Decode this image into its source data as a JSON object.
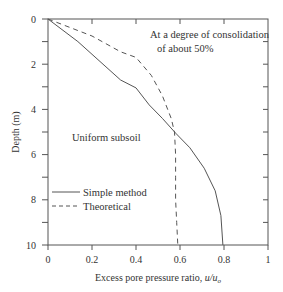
{
  "chart_data": {
    "type": "line",
    "title": "",
    "xlabel": "Excess pore pressure ratio, ",
    "xlabel_math": "u/u",
    "xlabel_sub": "o",
    "ylabel": "Depth (m)",
    "xlim": [
      0,
      1
    ],
    "ylim": [
      0,
      10
    ],
    "y_inverted": true,
    "grid": false,
    "x_ticks": [
      0,
      0.2,
      0.4,
      0.6,
      0.8,
      1
    ],
    "x_tick_labels": [
      "0",
      "0.2",
      "0.4",
      "0.6",
      "0.8",
      "1"
    ],
    "y_ticks": [
      0,
      2,
      4,
      6,
      8,
      10
    ],
    "y_tick_labels": [
      "0",
      "2",
      "4",
      "6",
      "8",
      "10"
    ],
    "y_minor_ticks": [
      1,
      3,
      5,
      7,
      9
    ],
    "annotations": [
      {
        "line1": "At a degree of consolidation",
        "line2": "of about 50%"
      },
      {
        "text": "Uniform subsoil"
      }
    ],
    "legend": {
      "placement": "lower-left",
      "entries": [
        {
          "label": "Simple method",
          "style": "solid"
        },
        {
          "label": "Theoretical",
          "style": "dashed"
        }
      ]
    },
    "series": [
      {
        "name": "Simple method",
        "style": "solid",
        "points": [
          [
            0,
            0
          ],
          [
            0.136,
            1.0
          ],
          [
            0.25,
            2.0
          ],
          [
            0.33,
            2.7
          ],
          [
            0.4,
            3.05
          ],
          [
            0.46,
            3.8
          ],
          [
            0.52,
            4.4
          ],
          [
            0.58,
            5.05
          ],
          [
            0.645,
            5.7
          ],
          [
            0.71,
            6.6
          ],
          [
            0.76,
            7.6
          ],
          [
            0.786,
            8.7
          ],
          [
            0.795,
            10.0
          ]
        ]
      },
      {
        "name": "Theoretical",
        "style": "dashed",
        "points": [
          [
            0,
            0
          ],
          [
            0.2,
            0.75
          ],
          [
            0.33,
            1.45
          ],
          [
            0.4,
            1.7
          ],
          [
            0.47,
            2.5
          ],
          [
            0.52,
            3.4
          ],
          [
            0.56,
            4.4
          ],
          [
            0.575,
            5.0
          ],
          [
            0.58,
            6.0
          ],
          [
            0.58,
            7.0
          ],
          [
            0.58,
            8.0
          ],
          [
            0.585,
            9.0
          ],
          [
            0.59,
            10.0
          ]
        ]
      }
    ]
  }
}
